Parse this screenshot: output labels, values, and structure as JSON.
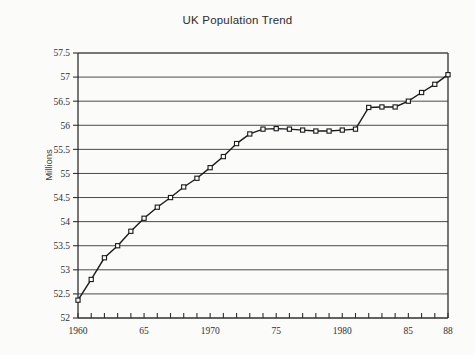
{
  "chart_data": {
    "type": "line",
    "title": "UK Population Trend",
    "xlabel": "",
    "ylabel": "Millions",
    "ylim": [
      52,
      57.5
    ],
    "xlim": [
      1960,
      1988
    ],
    "ytick_step": 0.5,
    "grid": true,
    "legend": "none",
    "marker": "open-square",
    "yticks": [
      "52",
      "52.5",
      "53",
      "53.5",
      "54",
      "54.5",
      "55",
      "55.5",
      "56",
      "56.5",
      "57",
      "57.5"
    ],
    "ytick_values": [
      52,
      52.5,
      53,
      53.5,
      54,
      54.5,
      55,
      55.5,
      56,
      56.5,
      57,
      57.5
    ],
    "xticks": [
      "1960",
      "65",
      "1970",
      "75",
      "1980",
      "85",
      "88"
    ],
    "xtick_values": [
      1960,
      1965,
      1970,
      1975,
      1980,
      1985,
      1988
    ],
    "x": [
      1960,
      1961,
      1962,
      1963,
      1964,
      1965,
      1966,
      1967,
      1968,
      1969,
      1970,
      1971,
      1972,
      1973,
      1974,
      1975,
      1976,
      1977,
      1978,
      1979,
      1980,
      1981,
      1982,
      1983,
      1984,
      1985,
      1986,
      1987,
      1988
    ],
    "values": [
      52.37,
      52.8,
      53.25,
      53.5,
      53.8,
      54.07,
      54.3,
      54.5,
      54.72,
      54.9,
      55.12,
      55.35,
      55.62,
      55.82,
      55.92,
      55.93,
      55.92,
      55.9,
      55.88,
      55.88,
      55.9,
      55.92,
      56.37,
      56.38,
      56.38,
      56.5,
      56.68,
      56.85,
      57.05
    ],
    "series_name": "UK Population"
  },
  "colors": {
    "background": "#fbfbfa",
    "axis": "#2f2f2f",
    "grid": "#4a4a4a",
    "line": "#1a1a1a",
    "marker_fill": "#fbfbfa",
    "title_text": "#2b2b2b"
  }
}
